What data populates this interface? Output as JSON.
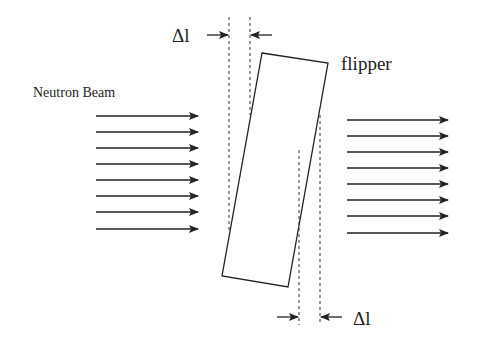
{
  "diagram": {
    "beam_label": "Neutron Beam",
    "flipper_label": "flipper",
    "delta_top_label": "Δl",
    "delta_bottom_label": "Δl",
    "colors": {
      "stroke": "#222222",
      "background": "#ffffff"
    },
    "incoming_arrows": {
      "count": 8,
      "x_start": 96,
      "x_end": 198,
      "y": [
        116,
        132,
        148,
        164,
        180,
        196,
        212,
        229
      ]
    },
    "outgoing_arrows": {
      "count": 8,
      "x_start": 347,
      "x_end": 448,
      "y": [
        120,
        136,
        152,
        168,
        184,
        200,
        216,
        233
      ]
    },
    "flipper_corners": [
      [
        262,
        53
      ],
      [
        328,
        63
      ],
      [
        288,
        287
      ],
      [
        222,
        276
      ]
    ]
  }
}
